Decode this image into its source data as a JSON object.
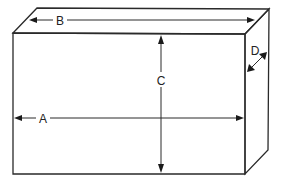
{
  "diagram": {
    "labels": {
      "a": "A",
      "b": "B",
      "c": "C",
      "d": "D"
    },
    "dimensions": [
      {
        "id": "A",
        "meaning": "front width"
      },
      {
        "id": "B",
        "meaning": "top depth-edge width"
      },
      {
        "id": "C",
        "meaning": "height"
      },
      {
        "id": "D",
        "meaning": "depth"
      }
    ],
    "colors": {
      "line": "#2a2a2a",
      "background": "#ffffff"
    }
  }
}
